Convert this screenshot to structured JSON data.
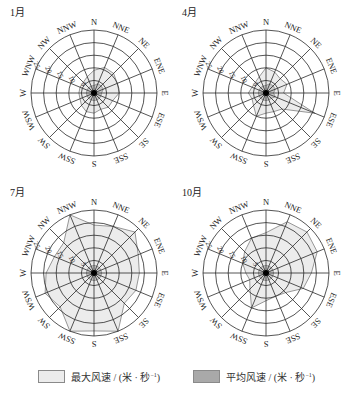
{
  "chart_data": [
    {
      "type": "radar",
      "title": "1月",
      "directions": [
        "N",
        "NNE",
        "NE",
        "ENE",
        "E",
        "ESE",
        "SE",
        "SSE",
        "S",
        "SSW",
        "SW",
        "WSW",
        "W",
        "WNW",
        "NW",
        "NNW"
      ],
      "radial_ticks": [
        5,
        10,
        15,
        20,
        25
      ],
      "rlim": [
        0,
        25
      ],
      "series": [
        {
          "name": "最大风速 / (米·秒⁻¹)",
          "values": [
            9,
            11,
            11,
            10,
            10,
            8,
            8,
            7,
            8,
            8,
            7,
            6,
            6,
            6,
            6,
            7
          ]
        },
        {
          "name": "平均风速 / (米·秒⁻¹)",
          "values": [
            3,
            4,
            4,
            4,
            3,
            3,
            3,
            3,
            3,
            3,
            3,
            3,
            3,
            3,
            3,
            3
          ]
        }
      ]
    },
    {
      "type": "radar",
      "title": "4月",
      "directions": [
        "N",
        "NNE",
        "NE",
        "ENE",
        "E",
        "ESE",
        "SE",
        "SSE",
        "S",
        "SSW",
        "SW",
        "WSW",
        "W",
        "WNW",
        "NW",
        "NNW"
      ],
      "radial_ticks": [
        5,
        10,
        15,
        20,
        25
      ],
      "rlim": [
        0,
        25
      ],
      "series": [
        {
          "name": "最大风速 / (米·秒⁻¹)",
          "values": [
            10,
            9,
            8,
            9,
            7,
            21,
            9,
            8,
            8,
            10,
            7,
            6,
            7,
            6,
            6,
            7
          ]
        },
        {
          "name": "平均风速 / (米·秒⁻¹)",
          "values": [
            3,
            4,
            4,
            4,
            3,
            4,
            3,
            3,
            3,
            3,
            3,
            3,
            3,
            3,
            3,
            3
          ]
        }
      ]
    },
    {
      "type": "radar",
      "title": "7月",
      "directions": [
        "N",
        "NNE",
        "NE",
        "ENE",
        "E",
        "ESE",
        "SE",
        "SSE",
        "S",
        "SSW",
        "SW",
        "WSW",
        "W",
        "WNW",
        "NW",
        "NNW"
      ],
      "radial_ticks": [
        5,
        10,
        15,
        20,
        25
      ],
      "rlim": [
        0,
        25
      ],
      "series": [
        {
          "name": "最大风速 / (米·秒⁻¹)",
          "values": [
            19,
            20,
            23,
            19,
            18,
            18,
            17,
            25,
            23,
            25,
            19,
            21,
            19,
            17,
            17,
            25
          ]
        },
        {
          "name": "平均风速 / (米·秒⁻¹)",
          "values": [
            3,
            3,
            3,
            3,
            3,
            3,
            3,
            3,
            3,
            3,
            3,
            3,
            3,
            3,
            3,
            3
          ]
        }
      ]
    },
    {
      "type": "radar",
      "title": "10月",
      "directions": [
        "N",
        "NNE",
        "NE",
        "ENE",
        "E",
        "ESE",
        "SE",
        "SSE",
        "S",
        "SSW",
        "SW",
        "WSW",
        "W",
        "WNW",
        "NW",
        "NNW"
      ],
      "radial_ticks": [
        5,
        10,
        15,
        20,
        25
      ],
      "rlim": [
        0,
        25
      ],
      "series": [
        {
          "name": "最大风速 / (米·秒⁻¹)",
          "values": [
            16,
            22,
            23,
            22,
            18,
            16,
            11,
            10,
            11,
            15,
            9,
            7,
            8,
            10,
            12,
            15
          ]
        },
        {
          "name": "平均风速 / (米·秒⁻¹)",
          "values": [
            3,
            3,
            3,
            3,
            3,
            3,
            3,
            3,
            3,
            3,
            3,
            3,
            3,
            3,
            3,
            3
          ]
        }
      ]
    }
  ],
  "panels": [
    {
      "title": "1月"
    },
    {
      "title": "4月"
    },
    {
      "title": "7月"
    },
    {
      "title": "10月"
    }
  ],
  "legend": {
    "max_label": "最大风速 / (米 · 秒",
    "avg_label": "平均风速 / (米 · 秒",
    "unit_exp": "−1",
    "unit_close": ")",
    "max_color": "#ececec",
    "avg_color": "#a9a9a9"
  },
  "colors": {
    "grid": "#2a2a2a",
    "max_fill": "#ececec",
    "avg_fill": "#c8c8c8",
    "outline": "#555555"
  }
}
